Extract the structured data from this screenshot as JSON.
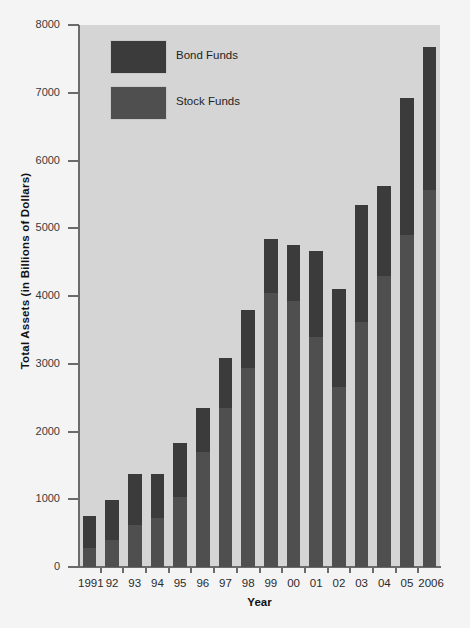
{
  "chart_data": {
    "type": "bar",
    "subtype": "stacked",
    "title": "",
    "xlabel": "Year",
    "ylabel": "Total Assets (in Billions of Dollars)",
    "ylim": [
      0,
      8000
    ],
    "yticks": [
      0,
      1000,
      2000,
      3000,
      4000,
      5000,
      6000,
      7000,
      8000
    ],
    "ytick_labels": [
      "0",
      "1000",
      "2000",
      "3000",
      "4000",
      "5000",
      "6000",
      "7000",
      "8000"
    ],
    "grid": false,
    "legend_position": "upper-left-inside",
    "categories": [
      "1991",
      "92",
      "93",
      "94",
      "95",
      "96",
      "97",
      "98",
      "99",
      "00",
      "01",
      "02",
      "03",
      "04",
      "05",
      "2006"
    ],
    "series": [
      {
        "name": "Stock Funds",
        "color": "#4f4f4f",
        "values": [
          280,
          400,
          620,
          720,
          1030,
          1700,
          2340,
          2930,
          4040,
          3930,
          3400,
          2650,
          3620,
          4300,
          4900,
          5560
        ]
      },
      {
        "name": "Bond Funds",
        "color": "#3b3b3b",
        "values": [
          470,
          590,
          750,
          660,
          800,
          650,
          740,
          860,
          800,
          830,
          1270,
          1460,
          1720,
          1320,
          2030,
          2110
        ]
      }
    ],
    "totals": [
      750,
      990,
      1370,
      1380,
      1830,
      2350,
      3080,
      3790,
      4840,
      4760,
      4670,
      4110,
      5340,
      5620,
      6930,
      7670
    ]
  },
  "legend": {
    "items": [
      {
        "label": "Bond Funds",
        "color": "#3b3b3b",
        "key": "bond"
      },
      {
        "label": "Stock Funds",
        "color": "#4f4f4f",
        "key": "stock"
      }
    ]
  },
  "colors": {
    "panel_background": "#d5d5d5",
    "page_background": "#f4f4f4",
    "axis": "#6b6b6b",
    "bond": "#3b3b3b",
    "stock": "#4f4f4f",
    "text": "#1f1f1f"
  }
}
